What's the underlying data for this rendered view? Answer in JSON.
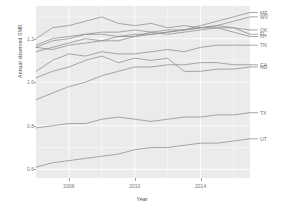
{
  "chart_data": {
    "type": "line",
    "title": "",
    "xlabel": "Year",
    "ylabel": "Annual observed SMR",
    "xlim": [
      2004,
      2017
    ],
    "ylim": [
      0.56,
      1.35
    ],
    "xticks": [
      2006,
      2010,
      2014
    ],
    "xtick_labels": [
      "2006",
      "2010",
      "2014"
    ],
    "yticks": [
      0.6,
      0.8,
      1.0,
      1.2
    ],
    "ytick_labels": [
      "0.6",
      "0.8",
      "1.0",
      "1.2"
    ],
    "grid": true,
    "legend": "right-end-labels",
    "line_color": "#8c8c8c",
    "panel_bg": "#ebebeb",
    "grid_color": "#ffffff",
    "x": [
      2004,
      2005,
      2006,
      2007,
      2008,
      2009,
      2010,
      2011,
      2012,
      2013,
      2014,
      2015,
      2016,
      2017
    ],
    "series": [
      {
        "name": "ME",
        "label": "ME",
        "values": [
          1.16,
          1.15,
          1.17,
          1.18,
          1.19,
          1.19,
          1.21,
          1.22,
          1.23,
          1.24,
          1.26,
          1.28,
          1.3,
          1.32
        ]
      },
      {
        "name": "WV",
        "label": "WV",
        "values": [
          1.14,
          1.16,
          1.18,
          1.2,
          1.19,
          1.21,
          1.22,
          1.22,
          1.23,
          1.24,
          1.25,
          1.26,
          1.28,
          1.3
        ]
      },
      {
        "name": "OK",
        "label": "OK",
        "values": [
          1.2,
          1.25,
          1.26,
          1.28,
          1.3,
          1.27,
          1.26,
          1.27,
          1.25,
          1.26,
          1.25,
          1.25,
          1.25,
          1.24
        ]
      },
      {
        "name": "FL",
        "label": "FL",
        "values": [
          1.17,
          1.2,
          1.21,
          1.22,
          1.23,
          1.23,
          1.24,
          1.23,
          1.24,
          1.24,
          1.25,
          1.26,
          1.25,
          1.22
        ]
      },
      {
        "name": "NY",
        "label": "NY",
        "values": [
          1.16,
          1.19,
          1.2,
          1.22,
          1.22,
          1.21,
          1.21,
          1.23,
          1.22,
          1.23,
          1.24,
          1.25,
          1.23,
          1.21
        ]
      },
      {
        "name": "TN",
        "label": "TN",
        "values": [
          1.05,
          1.1,
          1.13,
          1.12,
          1.14,
          1.13,
          1.13,
          1.14,
          1.15,
          1.14,
          1.16,
          1.17,
          1.17,
          1.17
        ]
      },
      {
        "name": "ND",
        "label": "ND",
        "values": [
          1.02,
          1.05,
          1.07,
          1.1,
          1.12,
          1.09,
          1.11,
          1.1,
          1.11,
          1.05,
          1.05,
          1.06,
          1.06,
          1.07
        ]
      },
      {
        "name": "CA",
        "label": "CA",
        "values": [
          0.92,
          0.95,
          0.98,
          1.0,
          1.03,
          1.05,
          1.07,
          1.07,
          1.08,
          1.08,
          1.09,
          1.09,
          1.08,
          1.08
        ]
      },
      {
        "name": "TX",
        "label": "TX",
        "values": [
          0.79,
          0.8,
          0.81,
          0.81,
          0.83,
          0.84,
          0.83,
          0.82,
          0.83,
          0.84,
          0.84,
          0.85,
          0.85,
          0.86
        ]
      },
      {
        "name": "UT",
        "label": "UT",
        "values": [
          0.61,
          0.63,
          0.64,
          0.65,
          0.66,
          0.67,
          0.69,
          0.7,
          0.7,
          0.71,
          0.72,
          0.72,
          0.73,
          0.74
        ]
      }
    ]
  },
  "axis": {
    "x_title": "Year",
    "y_title": "Annual observed SMR"
  }
}
